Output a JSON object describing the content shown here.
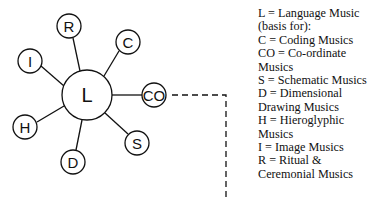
{
  "nodes": [
    {
      "id": "L",
      "label": "L",
      "cx": 87,
      "cy": 95,
      "r": 25
    },
    {
      "id": "R",
      "label": "R",
      "cx": 69,
      "cy": 26,
      "r": 12
    },
    {
      "id": "C",
      "label": "C",
      "cx": 128,
      "cy": 42,
      "r": 12
    },
    {
      "id": "I",
      "label": "I",
      "cx": 30,
      "cy": 61,
      "r": 12
    },
    {
      "id": "CO",
      "label": "CO",
      "cx": 154,
      "cy": 95,
      "r": 12
    },
    {
      "id": "H",
      "label": "H",
      "cx": 25,
      "cy": 127,
      "r": 12
    },
    {
      "id": "S",
      "label": "S",
      "cx": 137,
      "cy": 143,
      "r": 12
    },
    {
      "id": "D",
      "label": "D",
      "cx": 73,
      "cy": 162,
      "r": 12
    }
  ],
  "legend": [
    "L = Language Music (basis for):",
    "C = Coding Musics",
    "CO = Co-ordinate Musics",
    "S = Schematic Musics",
    "D = Dimensional Drawing Musics",
    "H = Hieroglyphic Musics",
    "I = Image Musics",
    "R = Ritual & Ceremonial Musics"
  ]
}
